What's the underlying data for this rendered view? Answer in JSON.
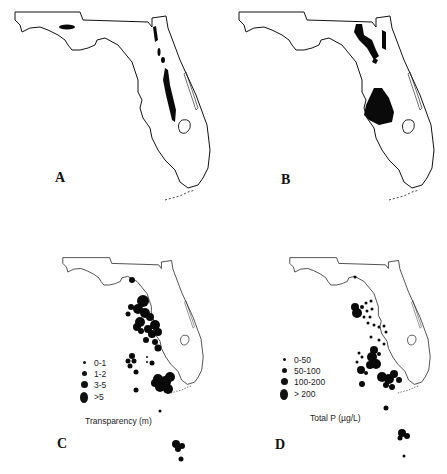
{
  "figure": {
    "panels": [
      {
        "id": "A",
        "label": "A"
      },
      {
        "id": "B",
        "label": "B"
      },
      {
        "id": "C",
        "label": "C",
        "legend_title": "Transparency (m)",
        "legend": [
          {
            "label": "0-1",
            "size": 3
          },
          {
            "label": "1-2",
            "size": 5
          },
          {
            "label": "3-5",
            "size": 7
          },
          {
            "label": ">5",
            "size": 11
          }
        ]
      },
      {
        "id": "D",
        "label": "D",
        "legend_title": "Total P (µg/L)",
        "legend": [
          {
            "label": "0-50",
            "size": 3
          },
          {
            "label": "50-100",
            "size": 5
          },
          {
            "label": "100-200",
            "size": 7
          },
          {
            "label": "> 200",
            "size": 11
          }
        ]
      }
    ],
    "colors": {
      "outline": "#111111",
      "fill": "#0a0a0a",
      "background": "#ffffff"
    }
  }
}
